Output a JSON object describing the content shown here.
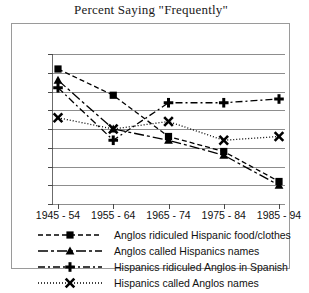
{
  "chart_data": {
    "type": "line",
    "title": "Percent Saying \"Frequently\"",
    "xlabel": "",
    "ylabel": "",
    "categories": [
      "1945 - 54",
      "1955 - 64",
      "1965 - 74",
      "1975 - 84",
      "1985 - 94"
    ],
    "ylim": [
      0,
      40
    ],
    "ytick_step": 5,
    "yticks": [
      40,
      35,
      30,
      25,
      20,
      15,
      10,
      5,
      0
    ],
    "grid": true,
    "legend_position": "bottom",
    "series": [
      {
        "name": "Anglos ridiculed Hispanic food/clothes",
        "marker": "square",
        "linestyle": "dashed",
        "color": "#000000",
        "values": [
          36,
          29,
          18,
          14,
          6
        ]
      },
      {
        "name": "Anglos called Hispanics names",
        "marker": "triangle",
        "linestyle": "dash-dot-long",
        "color": "#000000",
        "values": [
          33,
          20,
          17,
          13,
          5
        ]
      },
      {
        "name": "Hispanics ridiculed Anglos in Spanish",
        "marker": "plus",
        "linestyle": "dash-dot",
        "color": "#000000",
        "values": [
          31,
          17,
          27,
          27,
          28
        ]
      },
      {
        "name": "Hispanics called Anglos names",
        "marker": "x",
        "linestyle": "dotted",
        "color": "#000000",
        "values": [
          23,
          20,
          22,
          17,
          18
        ]
      }
    ]
  }
}
